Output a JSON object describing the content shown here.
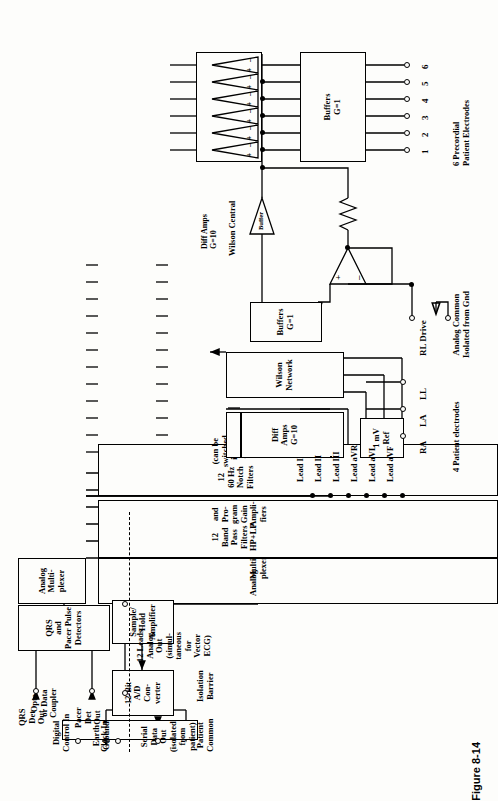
{
  "figure": {
    "caption": "Figure 8-14"
  },
  "outputs": {
    "qrs_det_out": "QRS\nDet\nOut",
    "pacer_det_out": "Pacer\nDet\nOut",
    "analog_out": "12 Leads\nAnalog\nOut\n(simul-\ntaneous\nfor\nVector\nECG)",
    "digital_control_in": "Digital\nControl In",
    "clock_in": "Clock In",
    "serial_data_out": "Serial\nData\nOut\n(isolated\nfrom\npatient)"
  },
  "blocks": {
    "qrs_pacer_detectors": "QRS\nand\nPacer Pulse\nDetectors",
    "analog_multiplexer_top": "Analog\nMulti-\nplexer",
    "analog_multiplexer_main": "Analog           Multi-\n                      plexer",
    "analog_mux_line1": "Analog",
    "analog_mux_line2": "Multi-\nplexer",
    "bandpass_filters": "12\nBand\nPass\nFilters\nHP+LP",
    "prog_gain_amps": "and\nPro-\ngram\nGain\nAmpli-\nfiers",
    "notch_filters": "12\n60 Hz\nNotch\nFilters",
    "notch_note": "(can be\nswitched\nin or out)",
    "sample_hold": "Sample/\nHold\nAmplifier",
    "ad_converter": "12-Bit\nA/D\nCon-\nverter",
    "opto_coupler": "Opto\nor Data\nCoupler",
    "diff_amps_limb": "Diff\nAmps\nG=10",
    "mv_ref": "1 mV\nRef",
    "wilson_network": "Wilson\nNetwork",
    "buffers_limb": "Buffers\nG=1",
    "buffers_precordial": "Buffers\nG=1",
    "diff_amps_precordial": "Diff Amps\nG=10",
    "buffer_triangle": "Buffer"
  },
  "leads": [
    {
      "label": "Lead I"
    },
    {
      "label": "Lead II"
    },
    {
      "label": "Lead III"
    },
    {
      "label": "Lead aVR"
    },
    {
      "label": "Lead aVL"
    },
    {
      "label": "Lead aVF"
    }
  ],
  "limb_electrodes": {
    "group_label": "4 Patient electrodes",
    "items": [
      {
        "label": "RA"
      },
      {
        "label": "LA"
      },
      {
        "label": "LL"
      },
      {
        "label": "RL Drive"
      }
    ]
  },
  "precordial": {
    "group_label": "6 Precordial\nPatient Electrodes",
    "items": [
      {
        "label": "1"
      },
      {
        "label": "2"
      },
      {
        "label": "3"
      },
      {
        "label": "4"
      },
      {
        "label": "5"
      },
      {
        "label": "6"
      }
    ]
  },
  "annotations": {
    "analog_common": "Analog Common\nIsolated from Gnd",
    "wilson_central": "Wilson Central",
    "earth_ground": "Earth\nGround",
    "patient_common": "Patient\nCommon",
    "isolation_barrier": "Isolation\nBarrier",
    "opamp_plus": "+",
    "opamp_minus": "–"
  },
  "colors": {
    "ink": "#000000",
    "paper": "#fdfdfb"
  }
}
